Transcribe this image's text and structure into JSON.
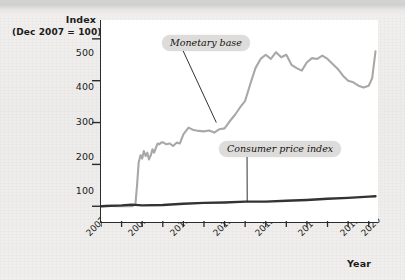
{
  "figure": {
    "y_axis_title_line1": "Index",
    "y_axis_title_line2": "(Dec 2007 = 100)",
    "x_axis_title": "Year"
  },
  "annotations": {
    "monetary_base_label": "Monetary base",
    "cpi_label": "Consumer price index"
  },
  "colors": {
    "monetary_base_line": "#a8a8a8",
    "cpi_line": "#333333",
    "axis": "#2b2b2b",
    "plot_background": "#ffffff",
    "page_background": "#efedeb",
    "callout_background": "#dedcda"
  },
  "chart_data": {
    "type": "line",
    "title": "",
    "subtitle": "",
    "xlabel": "Year",
    "ylabel": "Index (Dec 2007 = 100)",
    "xlim": [
      2007,
      2020.5
    ],
    "ylim": [
      60,
      545
    ],
    "grid": false,
    "legend_position": "inline-callouts",
    "ytick_labels": [
      "100",
      "200",
      "300",
      "400",
      "500"
    ],
    "ytick_values": [
      100,
      200,
      300,
      400,
      500
    ],
    "xtick_labels": [
      "2007",
      "2008",
      "2009",
      "2010",
      "2011",
      "2012",
      "2013",
      "2014",
      "2015",
      "2016",
      "2017",
      "2018",
      "2019",
      "2020"
    ],
    "xtick_values": [
      2007,
      2008,
      2009,
      2010,
      2011,
      2012,
      2013,
      2014,
      2015,
      2016,
      2017,
      2018,
      2019,
      2020
    ],
    "xtick_labels_shown": [
      "2007",
      "2009",
      "2011",
      "2013",
      "2015",
      "2017",
      "2019",
      "2020"
    ],
    "series": [
      {
        "name": "Monetary base",
        "color": "#a8a8a8",
        "x": [
          2007.0,
          2007.25,
          2007.5,
          2007.75,
          2008.0,
          2008.25,
          2008.5,
          2008.67,
          2008.75,
          2008.83,
          2008.92,
          2009.0,
          2009.08,
          2009.17,
          2009.25,
          2009.33,
          2009.42,
          2009.5,
          2009.58,
          2009.67,
          2009.75,
          2009.83,
          2009.92,
          2010.0,
          2010.17,
          2010.33,
          2010.5,
          2010.67,
          2010.83,
          2011.0,
          2011.25,
          2011.5,
          2011.75,
          2012.0,
          2012.25,
          2012.5,
          2012.75,
          2013.0,
          2013.25,
          2013.5,
          2013.75,
          2014.0,
          2014.25,
          2014.5,
          2014.75,
          2015.0,
          2015.25,
          2015.5,
          2015.75,
          2016.0,
          2016.25,
          2016.5,
          2016.75,
          2017.0,
          2017.25,
          2017.5,
          2017.75,
          2018.0,
          2018.25,
          2018.5,
          2018.75,
          2019.0,
          2019.25,
          2019.5,
          2019.75,
          2020.0,
          2020.17,
          2020.33
        ],
        "y": [
          100,
          101,
          101,
          100,
          100,
          101,
          100,
          104,
          150,
          205,
          222,
          214,
          232,
          220,
          228,
          212,
          222,
          236,
          228,
          240,
          250,
          248,
          252,
          253,
          248,
          250,
          244,
          252,
          250,
          272,
          288,
          282,
          280,
          279,
          281,
          276,
          284,
          286,
          303,
          318,
          336,
          352,
          392,
          430,
          452,
          462,
          452,
          468,
          456,
          462,
          438,
          430,
          424,
          444,
          454,
          452,
          460,
          452,
          440,
          428,
          412,
          400,
          396,
          388,
          384,
          388,
          406,
          470
        ],
        "notes": "Rises sharply in late 2008 (QE1), plateaus ~250 through 2010, steps up ~280 in 2011-2012, climbs to peak ~470 in 2014-2015, declines to ~385 by 2019, spikes to ~470 in early 2020."
      },
      {
        "name": "Consumer price index",
        "color": "#333333",
        "x": [
          2007.0,
          2008.0,
          2008.5,
          2009.0,
          2010.0,
          2011.0,
          2012.0,
          2013.0,
          2014.0,
          2015.0,
          2016.0,
          2017.0,
          2018.0,
          2019.0,
          2020.0,
          2020.33
        ],
        "y": [
          100,
          102,
          104,
          102,
          103,
          106,
          108,
          109,
          111,
          111,
          113,
          115,
          118,
          120,
          123,
          124
        ],
        "notes": "Nearly flat, rising gradually from 100 in Dec 2007 to about 124 by 2020."
      }
    ],
    "annotations": [
      {
        "text": "Monetary base",
        "points_to_x": 2012.6,
        "points_to_y": 300
      },
      {
        "text": "Consumer price index",
        "points_to_x": 2014.1,
        "points_to_y": 112
      }
    ]
  }
}
